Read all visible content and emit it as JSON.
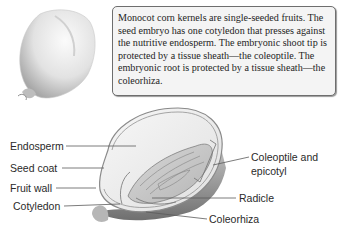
{
  "caption": {
    "text": "Monocot corn kernels are single-seeded fruits. The seed embryo has one cotyledon that presses against the nutritive endosperm. The embryonic shoot tip is protected by a tissue sheath—the coleoptile. The embryonic root is protected by a tissue sheath—the coleorhiza."
  },
  "labels": {
    "endosperm": "Endosperm",
    "seed_coat": "Seed coat",
    "fruit_wall": "Fruit wall",
    "cotyledon": "Cotyledon",
    "coleoptile_line1": "Coleoptile and",
    "coleoptile_line2": "epicotyl",
    "radicle": "Radicle",
    "coleorhiza": "Coleorhiza"
  },
  "colors": {
    "kernel_fill": "#e9e9e9",
    "kernel_shadow": "#9b9b9b",
    "box_border": "#6e6e6e",
    "box_fill": "#f4f4f4",
    "leader_line": "#5a5a5a"
  }
}
